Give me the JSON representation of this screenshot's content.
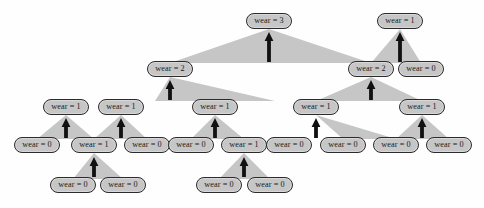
{
  "figure": {
    "type": "tree-diagram",
    "colors": {
      "node_fill": "#c6c6c6",
      "node_border": "#2b2b2b",
      "connector_fill": "#c6c6c6",
      "arrow": "#111111",
      "background": "#fefefe"
    },
    "label_template": "wear = {n}"
  },
  "nodes": [
    {
      "id": "n0",
      "label": "wear = 3",
      "x": 246,
      "y": 13,
      "w": 46
    },
    {
      "id": "n1",
      "label": "wear = 2",
      "x": 147,
      "y": 61,
      "w": 46
    },
    {
      "id": "n2",
      "label": "wear = 1",
      "x": 377,
      "y": 13,
      "w": 46
    },
    {
      "id": "n3",
      "label": "wear = 2",
      "x": 348,
      "y": 61,
      "w": 46
    },
    {
      "id": "n4",
      "label": "wear = 0",
      "x": 398,
      "y": 61,
      "w": 46
    },
    {
      "id": "n5",
      "label": "wear = 1",
      "x": 98,
      "y": 99,
      "w": 46
    },
    {
      "id": "n6",
      "label": "wear = 1",
      "x": 192,
      "y": 99,
      "w": 46
    },
    {
      "id": "n7",
      "label": "wear = 1",
      "x": 43,
      "y": 99,
      "w": 46
    },
    {
      "id": "n8",
      "label": "wear = 1",
      "x": 293,
      "y": 99,
      "w": 46
    },
    {
      "id": "n9",
      "label": "wear = 1",
      "x": 399,
      "y": 99,
      "w": 46
    },
    {
      "id": "n10",
      "label": "wear = 0",
      "x": 14,
      "y": 137,
      "w": 46
    },
    {
      "id": "n11",
      "label": "wear = 1",
      "x": 71,
      "y": 137,
      "w": 46
    },
    {
      "id": "n12",
      "label": "wear = 0",
      "x": 124,
      "y": 137,
      "w": 46
    },
    {
      "id": "n13",
      "label": "wear = 0",
      "x": 168,
      "y": 137,
      "w": 46
    },
    {
      "id": "n14",
      "label": "wear = 1",
      "x": 221,
      "y": 137,
      "w": 46
    },
    {
      "id": "n15",
      "label": "wear = 0",
      "x": 266,
      "y": 137,
      "w": 46
    },
    {
      "id": "n16",
      "label": "wear = 0",
      "x": 320,
      "y": 137,
      "w": 46
    },
    {
      "id": "n17",
      "label": "wear = 0",
      "x": 373,
      "y": 137,
      "w": 46
    },
    {
      "id": "n18",
      "label": "wear = 0",
      "x": 426,
      "y": 137,
      "w": 46
    },
    {
      "id": "n19",
      "label": "wear = 0",
      "x": 50,
      "y": 177,
      "w": 46
    },
    {
      "id": "n20",
      "label": "wear = 0",
      "x": 100,
      "y": 177,
      "w": 46
    },
    {
      "id": "n21",
      "label": "wear = 0",
      "x": 196,
      "y": 177,
      "w": 46
    },
    {
      "id": "n22",
      "label": "wear = 0",
      "x": 247,
      "y": 177,
      "w": 46
    }
  ],
  "connectors": [
    {
      "id": "c0",
      "parent": "n0",
      "left": "n1",
      "right": "n3"
    },
    {
      "id": "c1",
      "parent": "n2",
      "left": "n3",
      "right": "n4"
    },
    {
      "id": "c2",
      "parent": "n1",
      "left": "n6",
      "right": "n6"
    },
    {
      "id": "c3",
      "parent": "n3",
      "left": "n8",
      "right": "n9"
    },
    {
      "id": "c4",
      "parent": "n7",
      "left": "n10",
      "right": "n11"
    },
    {
      "id": "c5",
      "parent": "n5",
      "left": "n11",
      "right": "n12"
    },
    {
      "id": "c6",
      "parent": "n6",
      "left": "n13",
      "right": "n14"
    },
    {
      "id": "c7",
      "parent": "n8",
      "left": "n16",
      "right": "n17"
    },
    {
      "id": "c8",
      "parent": "n9",
      "left": "n17",
      "right": "n18"
    },
    {
      "id": "c9",
      "parent": "n11",
      "left": "n19",
      "right": "n20"
    },
    {
      "id": "c10",
      "parent": "n14",
      "left": "n21",
      "right": "n22"
    }
  ],
  "arrows": [
    {
      "id": "a0",
      "x": 269,
      "y_top": 32,
      "y_bottom": 62
    },
    {
      "id": "a1",
      "x": 400,
      "y_top": 32,
      "y_bottom": 62
    },
    {
      "id": "a2",
      "x": 170,
      "y_top": 80,
      "y_bottom": 100
    },
    {
      "id": "a3",
      "x": 371,
      "y_top": 80,
      "y_bottom": 100
    },
    {
      "id": "a4",
      "x": 66,
      "y_top": 118,
      "y_bottom": 138
    },
    {
      "id": "a5",
      "x": 121,
      "y_top": 118,
      "y_bottom": 138
    },
    {
      "id": "a6",
      "x": 215,
      "y_top": 118,
      "y_bottom": 138
    },
    {
      "id": "a7",
      "x": 316,
      "y_top": 118,
      "y_bottom": 138
    },
    {
      "id": "a8",
      "x": 422,
      "y_top": 118,
      "y_bottom": 138
    },
    {
      "id": "a9",
      "x": 94,
      "y_top": 157,
      "y_bottom": 177
    },
    {
      "id": "a10",
      "x": 244,
      "y_top": 157,
      "y_bottom": 177
    }
  ]
}
